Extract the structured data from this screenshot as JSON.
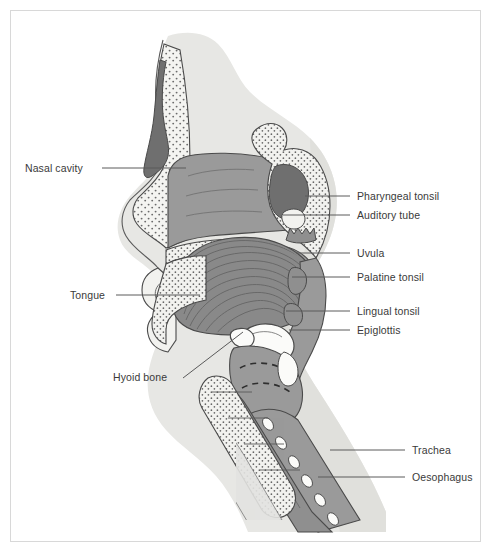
{
  "figure": {
    "type": "anatomical-diagram",
    "border_color": "#d8d8d8",
    "background_color": "#ffffff"
  },
  "palette": {
    "skin": "#e7e7e4",
    "skin_shadow": "#dededa",
    "mucosa": "#9a9a9a",
    "muscle": "#8f8f8f",
    "tongue": "#8a8a8a",
    "bone_light": "#f2f2ef",
    "sinus_dark": "#6f6f6f",
    "cartilage": "#ffffff",
    "outline": "#4a4a4a",
    "label_text": "#3a3a3a",
    "leader_line": "#5a5a5a"
  },
  "labels": {
    "left": [
      {
        "text": "Nasal cavity",
        "x": 25,
        "y": 162,
        "leader": {
          "x1": 102,
          "y1": 168,
          "x2": 186,
          "y2": 168
        }
      },
      {
        "text": "Tongue",
        "x": 70,
        "y": 289,
        "leader": {
          "x1": 116,
          "y1": 295,
          "x2": 200,
          "y2": 295
        }
      },
      {
        "text": "Hyoid bone",
        "x": 113,
        "y": 377,
        "leader": {
          "x1": 183,
          "y1": 378,
          "x2": 243,
          "y2": 332
        }
      }
    ],
    "right": [
      {
        "text": "Pharyngeal tonsil",
        "x": 357,
        "y": 190,
        "leader": {
          "x1": 305,
          "y1": 196,
          "x2": 350,
          "y2": 196
        }
      },
      {
        "text": "Auditory tube",
        "x": 357,
        "y": 209,
        "leader": {
          "x1": 283,
          "y1": 215,
          "x2": 350,
          "y2": 215
        }
      },
      {
        "text": "Uvula",
        "x": 357,
        "y": 247,
        "leader": {
          "x1": 296,
          "y1": 253,
          "x2": 350,
          "y2": 253
        }
      },
      {
        "text": "Palatine tonsil",
        "x": 357,
        "y": 271,
        "leader": {
          "x1": 292,
          "y1": 277,
          "x2": 350,
          "y2": 277
        }
      },
      {
        "text": "Lingual tonsil",
        "x": 357,
        "y": 305,
        "leader": {
          "x1": 286,
          "y1": 311,
          "x2": 350,
          "y2": 311
        }
      },
      {
        "text": "Epiglottis",
        "x": 357,
        "y": 324,
        "leader": {
          "x1": 289,
          "y1": 330,
          "x2": 350,
          "y2": 330
        }
      },
      {
        "text": "Trachea",
        "x": 412,
        "y": 444,
        "leader": {
          "x1": 330,
          "y1": 450,
          "x2": 405,
          "y2": 450
        }
      },
      {
        "text": "Oesophagus",
        "x": 412,
        "y": 471,
        "leader": {
          "x1": 318,
          "y1": 477,
          "x2": 405,
          "y2": 477
        }
      }
    ]
  }
}
